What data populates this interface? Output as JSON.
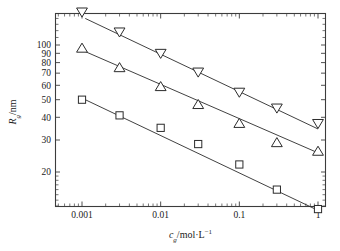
{
  "chart_data": {
    "type": "scatter",
    "title": "",
    "xlabel": "c_g/mol·L⁻¹",
    "ylabel": "R_g/nm",
    "xscale": "log",
    "yscale": "log",
    "xlim": [
      0.0004,
      1.35
    ],
    "ylim": [
      11.0,
      175.0
    ],
    "grid": false,
    "legend": "none",
    "xticks": [
      0.001,
      0.01,
      0.1,
      1
    ],
    "xticklabels": [
      "0.001",
      "0.01",
      "0.1",
      "1"
    ],
    "yticks": [
      20,
      30,
      40,
      50,
      60,
      70,
      80,
      90,
      100
    ],
    "yticklabels": [
      "20",
      "30",
      "40",
      "50",
      "60",
      "70",
      "80",
      "90",
      "100"
    ],
    "x": [
      0.001,
      0.003,
      0.01,
      0.03,
      0.1,
      0.3,
      1
    ],
    "series": [
      {
        "name": "series-down-triangle",
        "marker": "triangle-down",
        "values": [
          152,
          118,
          90,
          71,
          55,
          45,
          37
        ],
        "fit": {
          "x": [
            0.0011,
            1.0
          ],
          "y": [
            140,
            34.5
          ]
        }
      },
      {
        "name": "series-up-triangle",
        "marker": "triangle-up",
        "values": [
          96,
          75,
          59,
          47,
          37,
          29,
          26
        ],
        "fit": {
          "x": [
            0.0011,
            1.0
          ],
          "y": [
            92,
            25.5
          ]
        }
      },
      {
        "name": "series-square",
        "marker": "square",
        "values": [
          50,
          41,
          35,
          28.5,
          22,
          16,
          12.5
        ],
        "fit": {
          "x": [
            0.0011,
            1.0
          ],
          "y": [
            50,
            12.3
          ]
        }
      }
    ]
  },
  "axis": {
    "ylabel_symbol": "R",
    "ylabel_sub": "g",
    "ylabel_rest": "/nm",
    "xlabel_symbol": "c",
    "xlabel_sub": "g",
    "xlabel_rest": "/mol·L",
    "xlabel_sup": "−1"
  },
  "colors": {
    "frame": "#3c3c3c",
    "marker_stroke": "#2b2b2b",
    "marker_fill": "#ffffff",
    "line": "#2b2b2b",
    "text": "#1a1a1a",
    "background": "#ffffff"
  }
}
